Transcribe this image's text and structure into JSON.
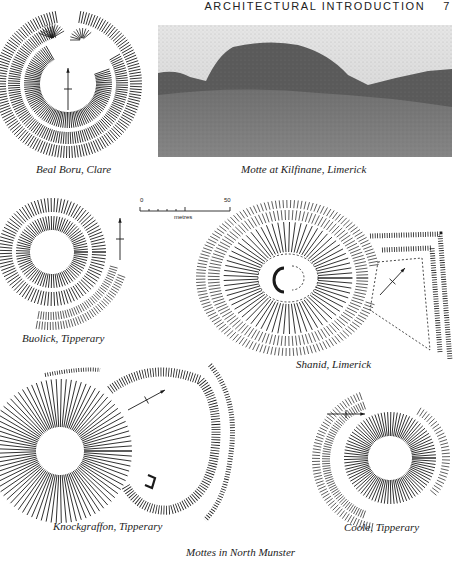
{
  "page": {
    "running_head": "ARCHITECTURAL INTRODUCTION",
    "page_number": "7"
  },
  "figures": [
    {
      "id": "beal-boru",
      "type": "site-plan",
      "caption": "Beal Boru, Clare"
    },
    {
      "id": "kilfinane",
      "type": "photograph",
      "caption": "Motte at Kilfinane, Limerick"
    },
    {
      "id": "buolick",
      "type": "site-plan",
      "caption": "Buolick, Tipperary"
    },
    {
      "id": "shanid",
      "type": "site-plan",
      "caption": "Shanid, Limerick"
    },
    {
      "id": "knockgraffon",
      "type": "site-plan",
      "caption": "Knockgraffon, Tipperary"
    },
    {
      "id": "coole",
      "type": "site-plan",
      "caption": "Coole, Tipperary"
    }
  ],
  "scale_bar": {
    "min_label": "0",
    "max_label": "50",
    "unit_label": "metres"
  },
  "plate_caption": "Mottes in North Munster",
  "colors": {
    "ink": "#1a1a1a",
    "paper": "#ffffff",
    "photo_sky": "#d9d9d9",
    "photo_ground": "#7a7a7a"
  }
}
